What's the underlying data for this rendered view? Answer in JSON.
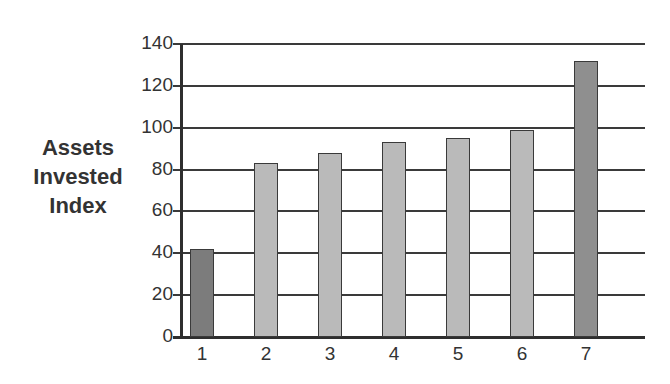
{
  "chart_data": {
    "type": "bar",
    "title": "",
    "xlabel": "",
    "ylabel": "Assets Invested Index",
    "ylabel_lines": [
      "Assets",
      "Invested",
      "Index"
    ],
    "categories": [
      "1",
      "2",
      "3",
      "4",
      "5",
      "6",
      "7"
    ],
    "values": [
      42,
      83,
      88,
      93,
      95,
      99,
      132
    ],
    "bar_colors": [
      "#7c7c7c",
      "#bababa",
      "#bababa",
      "#bababa",
      "#bababa",
      "#bababa",
      "#8f8f8f"
    ],
    "yticks": [
      0,
      20,
      40,
      60,
      80,
      100,
      120,
      140
    ],
    "ylim": [
      0,
      140
    ],
    "grid": true,
    "legend": null
  }
}
